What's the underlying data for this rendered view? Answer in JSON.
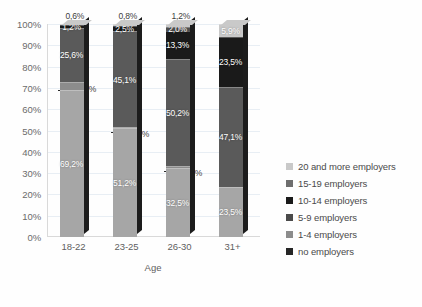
{
  "chart_data": {
    "type": "bar",
    "subtype": "100% stacked column",
    "title": "",
    "xlabel": "Age",
    "ylabel": "",
    "categories": [
      "18-22",
      "23-25",
      "26-30",
      "31+"
    ],
    "ylim": [
      0,
      100
    ],
    "ytick_labels": [
      "0%",
      "10%",
      "20%",
      "30%",
      "40%",
      "50%",
      "60%",
      "70%",
      "80%",
      "90%",
      "100%"
    ],
    "ytick_values": [
      0,
      10,
      20,
      30,
      40,
      50,
      60,
      70,
      80,
      90,
      100
    ],
    "grid": true,
    "legend_position": "right",
    "series": [
      {
        "name": "no employers",
        "color": "#a6a6a6",
        "values": [
          69.2,
          51.2,
          32.5,
          23.5
        ],
        "labels": [
          "69,2%",
          "51,2%",
          "32,5%",
          "23,5%"
        ]
      },
      {
        "name": "1-4 employers",
        "color": "#8c8c8c",
        "values": [
          3.5,
          0.4,
          0.8,
          0.0
        ],
        "labels": [
          "3,5%",
          "0,4%",
          "0,8%",
          ""
        ]
      },
      {
        "name": "5-9 employers",
        "color": "#5a5a5a",
        "values": [
          25.6,
          45.1,
          50.2,
          47.1
        ],
        "labels": [
          "25,6%",
          "45,1%",
          "50,2%",
          "47,1%"
        ]
      },
      {
        "name": "10-14 employers",
        "color": "#1a1a1a",
        "values": [
          1.2,
          2.5,
          13.3,
          23.5
        ],
        "labels": [
          "1,2%",
          "2,5%",
          "13,3%",
          "23,5%"
        ]
      },
      {
        "name": "15-19 employers",
        "color": "#4f4f4f",
        "values": [
          0.0,
          0.0,
          2.0,
          0.0
        ],
        "labels": [
          "",
          "",
          "2,0%",
          ""
        ]
      },
      {
        "name": "20 and more employers",
        "color": "#c9c9c9",
        "values": [
          0.6,
          0.8,
          1.2,
          5.9
        ],
        "labels": [
          "0,6%",
          "0,8%",
          "1,2%",
          "5,9%"
        ]
      }
    ]
  },
  "legend": {
    "items": [
      {
        "label": "20 and more employers",
        "color": "#c9c9c9"
      },
      {
        "label": "15-19 employers",
        "color": "#6e6e6e"
      },
      {
        "label": "10-14 employers",
        "color": "#1a1a1a"
      },
      {
        "label": "5-9 employers",
        "color": "#4a4a4a"
      },
      {
        "label": "1-4 employers",
        "color": "#8c8c8c"
      },
      {
        "label": "no employers",
        "color": "#262626"
      }
    ]
  },
  "axes": {
    "x_title": "Age",
    "x_categories": [
      "18-22",
      "23-25",
      "26-30",
      "31+"
    ],
    "y_ticks": [
      "100%",
      "90%",
      "80%",
      "70%",
      "60%",
      "50%",
      "40%",
      "30%",
      "20%",
      "10%",
      "0%"
    ]
  }
}
